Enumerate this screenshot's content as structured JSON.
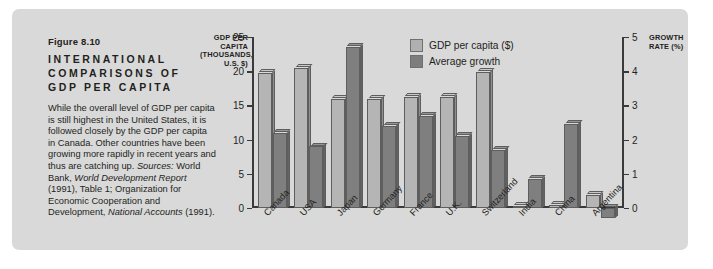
{
  "figure": {
    "number": "Figure 8.10",
    "title": "INTERNATIONAL COMPARISONS OF GDP PER CAPITA",
    "body_parts": [
      {
        "text": "While the overall level of GDP per capita is still highest in the United States, it is followed closely by the GDP per capita in Canada. Other countries have been growing more rapidly in recent years and thus are catching up. ",
        "italic": false
      },
      {
        "text": "Sources:",
        "italic": true
      },
      {
        "text": " World Bank, ",
        "italic": false
      },
      {
        "text": "World Development Report",
        "italic": true
      },
      {
        "text": " (1991), Table 1; Organization for Economic Cooperation and Development, ",
        "italic": false
      },
      {
        "text": "National Accounts",
        "italic": true
      },
      {
        "text": " (1991).",
        "italic": false
      }
    ]
  },
  "axis_captions": {
    "left": "GDP PER CAPITA (THOUSANDS, U.S. $)",
    "right": "GROWTH RATE (%)"
  },
  "legend": [
    {
      "label": "GDP per capita ($)",
      "swatch": "light",
      "color": "#b5b5b5"
    },
    {
      "label": "Average growth",
      "swatch": "dark",
      "color": "#7f7f7f"
    }
  ],
  "chart_data": {
    "type": "bar",
    "title": "International Comparisons of GDP per Capita",
    "xlabel": "",
    "ylabel": "GDP per capita (thousands, U.S. $)",
    "y2label": "Growth rate (%)",
    "ylim": [
      0,
      25
    ],
    "y2lim": [
      -1,
      5
    ],
    "yticks": [
      0,
      5,
      10,
      15,
      20,
      25
    ],
    "y2ticks": [
      0,
      1,
      2,
      3,
      4,
      5
    ],
    "ytick_labels": [
      "0",
      "5",
      "10",
      "15",
      "20",
      "25"
    ],
    "y2tick_labels": [
      "0",
      "1",
      "2",
      "3",
      "4",
      "5"
    ],
    "grid": false,
    "legend_position": "top-center",
    "categories": [
      "Canada",
      "USA",
      "Japan",
      "Germany",
      "France",
      "U.K.",
      "Switzerland",
      "India",
      "China",
      "Argentina"
    ],
    "series": [
      {
        "name": "GDP per capita ($)",
        "axis": "left",
        "units": "thousands U.S. $",
        "values": [
          19.7,
          20.5,
          16.0,
          16.0,
          16.3,
          16.2,
          19.9,
          0.35,
          0.4,
          1.9
        ]
      },
      {
        "name": "Average growth",
        "axis": "right",
        "units": "percent",
        "values": [
          2.2,
          1.8,
          4.7,
          2.4,
          2.7,
          2.1,
          1.7,
          0.85,
          2.45,
          -0.3
        ]
      }
    ]
  }
}
